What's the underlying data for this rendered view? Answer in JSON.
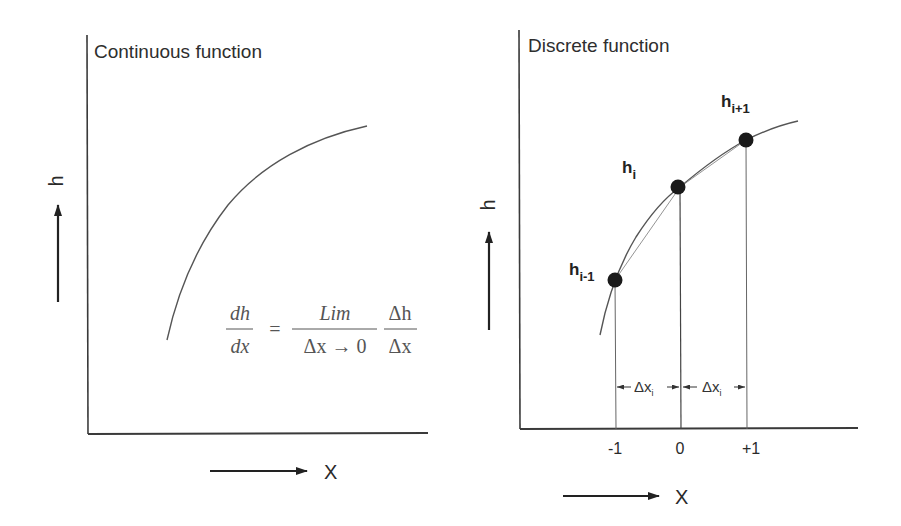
{
  "left_panel": {
    "title": "Continuous function",
    "y_axis_label": "h",
    "x_axis_label": "X",
    "formula": {
      "lhs_num": "dh",
      "lhs_den": "dx",
      "equals": "=",
      "lim_num": "Lim",
      "lim_den": "Δx → 0",
      "rhs_num": "Δh",
      "rhs_den": "Δx"
    }
  },
  "right_panel": {
    "title": "Discrete function",
    "y_axis_label": "h",
    "x_axis_label": "X",
    "points": [
      {
        "base": "h",
        "sub": "i-1"
      },
      {
        "base": "h",
        "sub": "i"
      },
      {
        "base": "h",
        "sub": "i+1"
      }
    ],
    "ticks": [
      "-1",
      "0",
      "+1"
    ],
    "intervals": [
      {
        "base": "Δx",
        "sub": "i"
      },
      {
        "base": "Δx",
        "sub": "i"
      }
    ]
  },
  "colors": {
    "line": "#333333",
    "curve": "#555555",
    "point": "#1a1a1a",
    "background": "#ffffff"
  }
}
